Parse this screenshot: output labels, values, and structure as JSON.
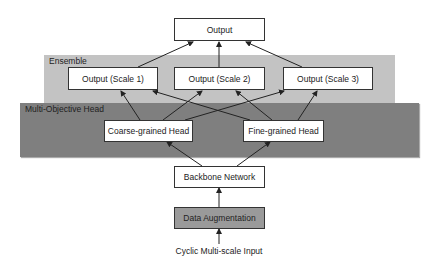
{
  "diagram": {
    "regions": {
      "ensemble": {
        "label": "Ensemble",
        "fill": "#c3c3c3"
      },
      "multi_objective_head": {
        "label": "Multi-Objective Head",
        "fill": "#7f7f7f"
      }
    },
    "nodes": {
      "output": "Output",
      "output_scale1": "Output (Scale 1)",
      "output_scale2": "Output (Scale 2)",
      "output_scale3": "Output (Scale 3)",
      "coarse_head": "Coarse-grained Head",
      "fine_head": "Fine-grained Head",
      "backbone": "Backbone Network",
      "data_augmentation": "Data Augmentation",
      "input": "Cyclic Multi-scale Input"
    },
    "edges": [
      [
        "Cyclic Multi-scale Input",
        "Data Augmentation"
      ],
      [
        "Data Augmentation",
        "Backbone Network"
      ],
      [
        "Backbone Network",
        "Coarse-grained Head"
      ],
      [
        "Backbone Network",
        "Fine-grained Head"
      ],
      [
        "Coarse-grained Head",
        "Output (Scale 1)"
      ],
      [
        "Coarse-grained Head",
        "Output (Scale 2)"
      ],
      [
        "Coarse-grained Head",
        "Output (Scale 3)"
      ],
      [
        "Fine-grained Head",
        "Output (Scale 1)"
      ],
      [
        "Fine-grained Head",
        "Output (Scale 2)"
      ],
      [
        "Fine-grained Head",
        "Output (Scale 3)"
      ],
      [
        "Output (Scale 1)",
        "Output"
      ],
      [
        "Output (Scale 2)",
        "Output"
      ],
      [
        "Output (Scale 3)",
        "Output"
      ]
    ]
  }
}
